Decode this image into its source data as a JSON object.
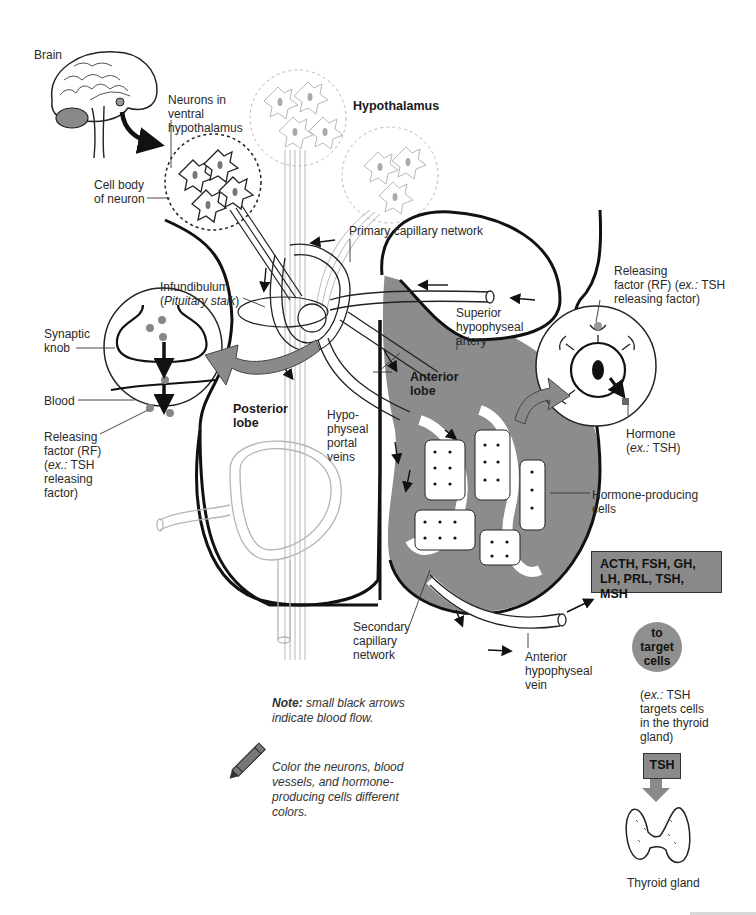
{
  "diagram": {
    "labels": {
      "brain": "Brain",
      "neurons_ventral": "Neurons in\nventral\nhypothalamus",
      "hypothalamus": "Hypothalamus",
      "cell_body": "Cell body\nof neuron",
      "primary_capillary": "Primary capillary network",
      "infundibulum": "Infundibulum",
      "pituitary_stalk": "Pituitary stalk",
      "synaptic_knob": "Synaptic\nknob",
      "blood": "Blood",
      "releasing_factor_left_line1": "Releasing\nfactor (RF)",
      "releasing_factor_left_ex": "ex.:",
      "releasing_factor_left_rest": " TSH\nreleasing\nfactor)",
      "releasing_factor_right_line1": "Releasing",
      "releasing_factor_right_line2": "factor (RF) (",
      "releasing_factor_right_ex": "ex.:",
      "releasing_factor_right_line2b": " TSH",
      "releasing_factor_right_line3": "releasing factor)",
      "superior_artery": "Superior\nhypophyseal\nartery",
      "anterior_lobe": "Anterior\nlobe",
      "posterior_lobe": "Posterior\nlobe",
      "portal_veins": "Hypo-\nphyseal\nportal\nveins",
      "hormone": "Hormone",
      "hormone_ex": "ex.:",
      "hormone_ex_rest": " TSH)",
      "hormone_producing_cells": "Hormone-producing\ncells",
      "secondary_capillary": "Secondary\ncapillary\nnetwork",
      "anterior_vein": "Anterior\nhypophyseal\nvein"
    },
    "hormone_box": "ACTH, FSH, GH,\nLH, PRL, TSH, MSH",
    "target_circle": "to\ntarget\ncells",
    "target_example_ex": "ex.:",
    "target_example_rest": " TSH\ntargets cells\nin the thyroid\ngland)",
    "tsh_box": "TSH",
    "thyroid_label": "Thyroid gland",
    "note_bold": "Note:",
    "note_text": " small black arrows indicate blood flow.",
    "coloring_instruction": "Color the neurons, blood vessels, and hormone-producing cells different colors.",
    "icons": [
      "brain-illustration",
      "crayon-icon",
      "thyroid-illustration",
      "down-arrow-icon"
    ],
    "colors": {
      "anterior_lobe_fill": "#8c8c8c",
      "box_fill": "#8a8a8a",
      "arrow_gray": "#8a8a8a",
      "line_dark": "#111111",
      "line_light": "#b5b5b5"
    }
  }
}
